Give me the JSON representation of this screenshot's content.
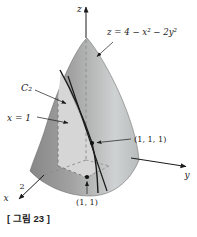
{
  "figure": {
    "caption": "[ 그림 23 ]",
    "equation_label": "z = 4 − x² − 2y²",
    "curve_label": "C₂",
    "plane_label": "x = 1",
    "point_label_3d": "(1, 1, 1)",
    "point_label_2d": "(1, 1)",
    "x_axis_tick": "2",
    "axes": {
      "x": "x",
      "y": "y",
      "z": "z"
    }
  },
  "colors": {
    "background": "#ffffff",
    "surface_dark": "#878787",
    "surface_mid": "#a2a2a2",
    "surface_light": "#cfd2d2",
    "surface_edge": "#6e6e6e",
    "plane_fill": "#d6d6d6",
    "line": "#1a1a1a",
    "dash": "#777777"
  }
}
